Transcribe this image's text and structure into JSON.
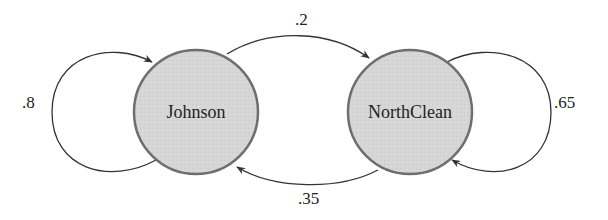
{
  "diagram": {
    "type": "state-transition",
    "colors": {
      "node_fill": "#d6d6d6",
      "node_stroke": "#6e6e6e",
      "edge": "#333333",
      "text": "#222222"
    },
    "nodes": [
      {
        "id": "johnson",
        "label": "Johnson"
      },
      {
        "id": "northclean",
        "label": "NorthClean"
      }
    ],
    "edges": [
      {
        "from": "johnson",
        "to": "johnson",
        "label": ".8"
      },
      {
        "from": "johnson",
        "to": "northclean",
        "label": ".2"
      },
      {
        "from": "northclean",
        "to": "northclean",
        "label": ".65"
      },
      {
        "from": "northclean",
        "to": "johnson",
        "label": ".35"
      }
    ]
  }
}
